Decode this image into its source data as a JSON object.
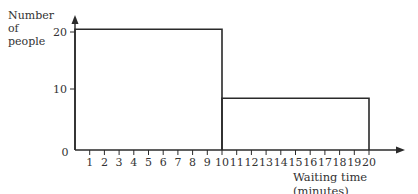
{
  "chart_data": {
    "type": "bar",
    "subtype": "histogram",
    "title": "",
    "xlabel": "Waiting time (minutes)",
    "ylabel": "Number of people",
    "x_ticks": [
      1,
      2,
      3,
      4,
      5,
      6,
      7,
      8,
      9,
      10,
      11,
      12,
      13,
      14,
      15,
      16,
      17,
      18,
      19,
      20
    ],
    "y_ticks": [
      0,
      10,
      20
    ],
    "origin_label": "0",
    "xlim": [
      0,
      20
    ],
    "ylim": [
      0,
      22
    ],
    "bins": [
      {
        "from": 0,
        "to": 10,
        "value": 21
      },
      {
        "from": 10,
        "to": 20,
        "value": 9
      }
    ],
    "categories": [
      "0-10",
      "10-20"
    ],
    "values": [
      21,
      9
    ],
    "grid": false,
    "legend": null
  },
  "labels": {
    "ylabel_line1": "Number",
    "ylabel_line2": "of",
    "ylabel_line3": "people",
    "xlabel": "Waiting time (minutes)",
    "y0": "0",
    "y10": "10",
    "y20": "20"
  },
  "colors": {
    "line": "#2a2a2a",
    "text": "#333333",
    "background": "#ffffff"
  }
}
